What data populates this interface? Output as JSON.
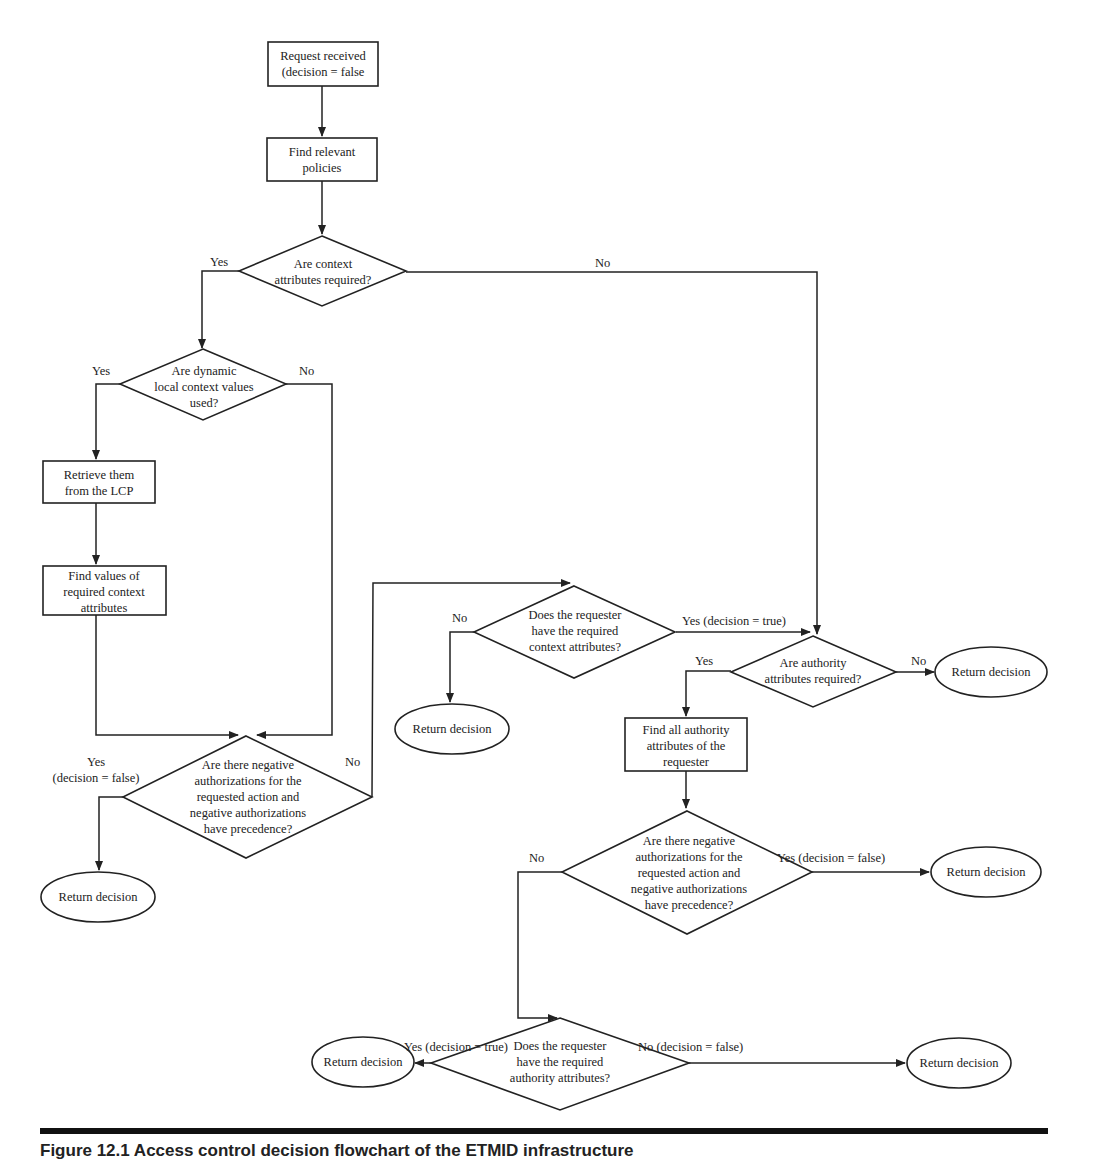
{
  "figure": {
    "caption": "Figure 12.1   Access control decision flowchart of the ETMID infrastructure"
  },
  "nodes": {
    "request_received": [
      "Request received",
      "(decision = false"
    ],
    "find_policies": [
      "Find relevant",
      "policies"
    ],
    "context_required": [
      "Are context",
      "attributes required?"
    ],
    "dynamic_values": [
      "Are dynamic",
      "local context values",
      "used?"
    ],
    "retrieve_lcp": [
      "Retrieve them",
      "from the LCP"
    ],
    "find_values": [
      "Find values of",
      "required context",
      "attributes"
    ],
    "negative_auth_1": [
      "Are there negative",
      "authorizations for the",
      "requested action and",
      "negative authorizations",
      "have precedence?"
    ],
    "return_1": [
      "Return decision"
    ],
    "has_context": [
      "Does the requester",
      "have the required",
      "context attributes?"
    ],
    "return_2": [
      "Return decision"
    ],
    "authority_required": [
      "Are authority",
      "attributes required?"
    ],
    "return_3": [
      "Return decision"
    ],
    "find_authority": [
      "Find all authority",
      "attributes of the",
      "requester"
    ],
    "negative_auth_2": [
      "Are there negative",
      "authorizations for the",
      "requested action and",
      "negative authorizations",
      "have precedence?"
    ],
    "return_4": [
      "Return decision"
    ],
    "has_authority": [
      "Does the requester",
      "have the required",
      "authority attributes?"
    ],
    "return_5": [
      "Return decision"
    ],
    "return_6": [
      "Return decision"
    ]
  },
  "edge_labels": {
    "context_yes": "Yes",
    "context_no": "No",
    "dynamic_yes": "Yes",
    "dynamic_no": "No",
    "neg1_yes": [
      "Yes",
      "(decision = false)"
    ],
    "neg1_no": "No",
    "has_context_no": "No",
    "has_context_yes": "Yes (decision = true)",
    "authority_yes": "Yes",
    "authority_no": "No",
    "neg2_no": "No",
    "neg2_yes": "Yes (decision = false)",
    "has_authority_yes": "Yes (decision = true)",
    "has_authority_no": "No (decision = false)"
  },
  "colors": {
    "stroke": "#222222",
    "background": "#ffffff"
  }
}
